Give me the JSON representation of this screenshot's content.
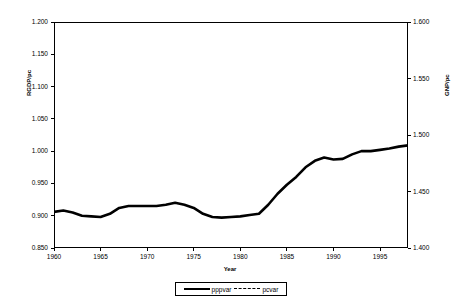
{
  "chart_data": {
    "type": "line",
    "title": "",
    "xlabel": "Year",
    "ylabel": "RGDP/pc",
    "ylabel_secondary": "GNP/pc",
    "grid": false,
    "legend_position": "bottom-center",
    "xlim": [
      1960,
      1998
    ],
    "xticks": [
      "1960",
      "1965",
      "1970",
      "1975",
      "1980",
      "1985",
      "1990",
      "1995"
    ],
    "xtick_values": [
      1960,
      1965,
      1970,
      1975,
      1980,
      1985,
      1990,
      1995
    ],
    "ylim": [
      0.85,
      1.2
    ],
    "yticks": [
      "0.850",
      "0.900",
      "0.950",
      "1.000",
      "1.050",
      "1.100",
      "1.150",
      "1.200"
    ],
    "ytick_values": [
      0.85,
      0.9,
      0.95,
      1.0,
      1.05,
      1.1,
      1.15,
      1.2
    ],
    "ylim_secondary": [
      1.4,
      1.6
    ],
    "yticks_secondary": [
      "1.400",
      "1.450",
      "1.500",
      "1.550",
      "1.600"
    ],
    "ytick_values_secondary": [
      1.4,
      1.45,
      1.5,
      1.55,
      1.6
    ],
    "x": [
      1960,
      1961,
      1962,
      1963,
      1964,
      1965,
      1966,
      1967,
      1968,
      1969,
      1970,
      1971,
      1972,
      1973,
      1974,
      1975,
      1976,
      1977,
      1978,
      1979,
      1980,
      1981,
      1982,
      1983,
      1984,
      1985,
      1986,
      1987,
      1988,
      1989,
      1990,
      1991,
      1992,
      1993,
      1994,
      1995,
      1996,
      1997,
      1998
    ],
    "series": [
      {
        "name": "pppvar",
        "axis": "left",
        "style": "solid",
        "color": "#000000",
        "values": [
          0.906,
          0.908,
          0.905,
          0.9,
          0.899,
          0.898,
          0.903,
          0.912,
          0.915,
          0.915,
          0.915,
          0.915,
          0.917,
          0.92,
          0.917,
          0.912,
          0.903,
          0.898,
          0.897,
          0.898,
          0.899,
          0.901,
          0.903,
          0.917,
          0.934,
          0.948,
          0.96,
          0.975,
          0.985,
          0.99,
          0.987,
          0.988,
          0.995,
          1.0,
          1.0,
          1.002,
          1.004,
          1.007,
          1.009
        ]
      },
      {
        "name": "pcvar",
        "axis": "right",
        "style": "dashed",
        "color": "#000000",
        "values": [
          1.001,
          1.009,
          1.014,
          1.015,
          1.013,
          1.012,
          1.016,
          1.018,
          1.015,
          1.012,
          1.012,
          1.012,
          1.011,
          1.008,
          0.999,
          0.985,
          0.965,
          0.94,
          0.92,
          0.907,
          0.903,
          0.904,
          0.907,
          0.92,
          0.946,
          0.972,
          0.996,
          1.02,
          1.018,
          1.028,
          1.034,
          1.028,
          1.017,
          1.007,
          0.998,
          0.994,
          0.996,
          0.998,
          1.002
        ]
      }
    ]
  },
  "legend": {
    "entries": [
      {
        "label": "pppvar",
        "style": "solid"
      },
      {
        "label": "pcvar",
        "style": "dashed"
      }
    ]
  }
}
